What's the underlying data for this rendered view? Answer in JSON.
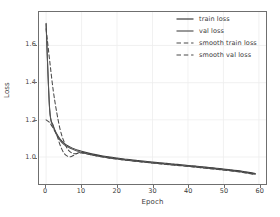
{
  "chart_data": {
    "type": "line",
    "title": "",
    "xlabel": "Epoch",
    "ylabel": "Loss",
    "xlim": [
      -2.0,
      62.0
    ],
    "ylim": [
      0.855,
      1.78
    ],
    "xticks": [
      0,
      10,
      20,
      30,
      40,
      50,
      60
    ],
    "yticks": [
      1.0,
      1.2,
      1.4,
      1.6
    ],
    "xtick_labels": [
      "0",
      "10",
      "20",
      "30",
      "40",
      "50",
      "60"
    ],
    "ytick_labels": [
      "1.0",
      "1.2",
      "1.4",
      "1.6"
    ],
    "grid": true,
    "grid_color": "#ededed",
    "legend_position": "upper right",
    "legend_frame": false,
    "x": [
      0,
      1,
      2,
      3,
      4,
      5,
      6,
      7,
      8,
      9,
      10,
      12,
      14,
      16,
      18,
      20,
      22,
      24,
      26,
      28,
      30,
      32,
      34,
      36,
      38,
      40,
      42,
      44,
      46,
      48,
      50,
      52,
      54,
      56,
      58,
      59
    ],
    "series": [
      {
        "name": "train loss",
        "style": "solid",
        "color": "#3d3d3d",
        "values": [
          1.72,
          1.26,
          1.17,
          1.125,
          1.095,
          1.075,
          1.062,
          1.052,
          1.044,
          1.037,
          1.031,
          1.021,
          1.013,
          1.006,
          1.0,
          0.995,
          0.99,
          0.985,
          0.981,
          0.977,
          0.973,
          0.969,
          0.966,
          0.962,
          0.959,
          0.955,
          0.952,
          0.948,
          0.944,
          0.94,
          0.936,
          0.932,
          0.927,
          0.921,
          0.915,
          0.912
        ]
      },
      {
        "name": "val loss",
        "style": "solid",
        "color": "#555555",
        "values": [
          1.715,
          1.255,
          1.165,
          1.118,
          1.088,
          1.068,
          1.055,
          1.046,
          1.038,
          1.031,
          1.025,
          1.015,
          1.007,
          1.0,
          0.994,
          0.989,
          0.984,
          0.98,
          0.976,
          0.972,
          0.968,
          0.964,
          0.961,
          0.957,
          0.954,
          0.95,
          0.947,
          0.943,
          0.939,
          0.935,
          0.931,
          0.927,
          0.922,
          0.916,
          0.91,
          0.907
        ]
      },
      {
        "name": "smooth train loss",
        "style": "dashed",
        "color": "#4a4a4a",
        "values": [
          1.2,
          1.185,
          1.155,
          1.118,
          1.062,
          1.022,
          1.005,
          1.002,
          1.012,
          1.022,
          1.026,
          1.018,
          1.01,
          1.003,
          0.997,
          0.992,
          0.987,
          0.983,
          0.979,
          0.975,
          0.971,
          0.967,
          0.964,
          0.96,
          0.957,
          0.953,
          0.95,
          0.946,
          0.942,
          0.938,
          0.934,
          0.93,
          0.925,
          0.919,
          0.913,
          0.91
        ]
      },
      {
        "name": "smooth val loss",
        "style": "dashed",
        "color": "#4a4a4a",
        "values": [
          1.69,
          1.52,
          1.36,
          1.24,
          1.145,
          1.085,
          1.045,
          1.025,
          1.018,
          1.02,
          1.022,
          1.015,
          1.007,
          1.0,
          0.994,
          0.989,
          0.984,
          0.98,
          0.976,
          0.972,
          0.968,
          0.964,
          0.96,
          0.957,
          0.953,
          0.95,
          0.946,
          0.942,
          0.938,
          0.934,
          0.93,
          0.926,
          0.921,
          0.915,
          0.909,
          0.906
        ]
      }
    ]
  },
  "legend": {
    "entries": [
      {
        "label": "train loss"
      },
      {
        "label": "val loss"
      },
      {
        "label": "smooth train loss"
      },
      {
        "label": "smooth val loss"
      }
    ]
  },
  "axes": {
    "xlabel": "Epoch",
    "ylabel": "Loss"
  }
}
